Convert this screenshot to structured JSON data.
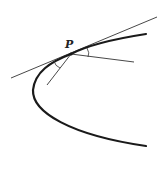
{
  "diagram": {
    "type": "geometry",
    "point_label": "P",
    "colors": {
      "curve": "#1a1a1a",
      "lines": "#333333",
      "background": "#ffffff"
    },
    "elements": [
      {
        "name": "parabola",
        "style": "thick"
      },
      {
        "name": "tangent-line",
        "through": "P"
      },
      {
        "name": "line-to-right",
        "from": "P"
      },
      {
        "name": "line-to-lower-left",
        "from": "P"
      },
      {
        "name": "angle-arc-right"
      },
      {
        "name": "angle-arc-left"
      }
    ]
  }
}
